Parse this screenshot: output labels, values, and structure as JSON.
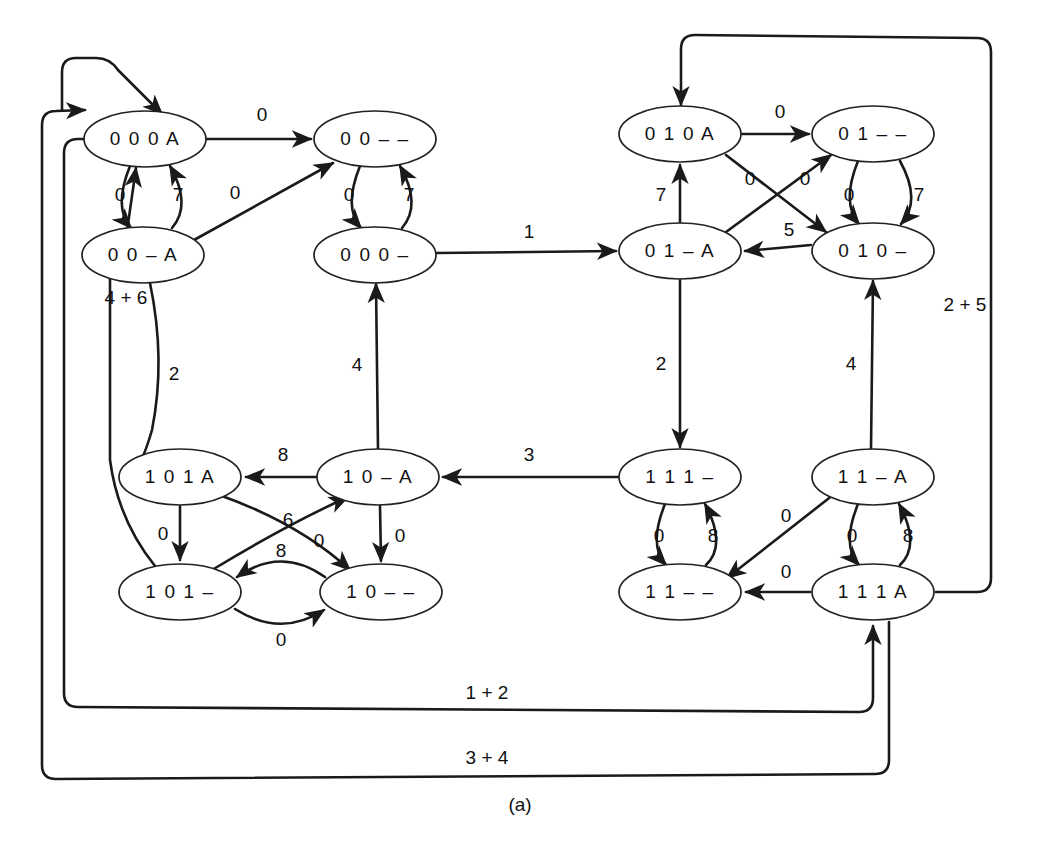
{
  "figure": {
    "caption": "(a)",
    "kind": "state-transition-diagram",
    "stroke_color": "#1a1a1a",
    "node_fill": "#ffffff",
    "background": "#ffffff"
  },
  "nodes": [
    {
      "id": "000A",
      "label": "0 0 0 A",
      "cx": 145,
      "cy": 139,
      "rx": 61,
      "ry": 28
    },
    {
      "id": "00--",
      "label": "0 0 – –",
      "cx": 375,
      "cy": 139,
      "rx": 61,
      "ry": 28
    },
    {
      "id": "00-A",
      "label": "0 0 – A",
      "cx": 143,
      "cy": 255,
      "rx": 61,
      "ry": 28
    },
    {
      "id": "000-",
      "label": "0 0 0 –",
      "cx": 375,
      "cy": 255,
      "rx": 61,
      "ry": 28
    },
    {
      "id": "010A",
      "label": "0 1 0 A",
      "cx": 680,
      "cy": 134,
      "rx": 61,
      "ry": 28
    },
    {
      "id": "01--",
      "label": "0 1 – –",
      "cx": 873,
      "cy": 134,
      "rx": 61,
      "ry": 28
    },
    {
      "id": "01-A",
      "label": "0 1 – A",
      "cx": 680,
      "cy": 251,
      "rx": 61,
      "ry": 28
    },
    {
      "id": "010-",
      "label": "0 1 0 –",
      "cx": 873,
      "cy": 251,
      "rx": 61,
      "ry": 28
    },
    {
      "id": "101A",
      "label": "1 0 1 A",
      "cx": 180,
      "cy": 477,
      "rx": 61,
      "ry": 28
    },
    {
      "id": "10-A",
      "label": "1 0 – A",
      "cx": 378,
      "cy": 477,
      "rx": 61,
      "ry": 28
    },
    {
      "id": "111-",
      "label": "1 1 1 –",
      "cx": 680,
      "cy": 477,
      "rx": 61,
      "ry": 28
    },
    {
      "id": "11-A",
      "label": "1 1 – A",
      "cx": 873,
      "cy": 477,
      "rx": 61,
      "ry": 28
    },
    {
      "id": "101-",
      "label": "1 0 1 –",
      "cx": 180,
      "cy": 592,
      "rx": 61,
      "ry": 28
    },
    {
      "id": "10--",
      "label": "1 0 – –",
      "cx": 381,
      "cy": 592,
      "rx": 61,
      "ry": 28
    },
    {
      "id": "11--",
      "label": "1 1 – –",
      "cx": 680,
      "cy": 592,
      "rx": 61,
      "ry": 28
    },
    {
      "id": "111A",
      "label": "1 1 1 A",
      "cx": 873,
      "cy": 592,
      "rx": 61,
      "ry": 28
    }
  ],
  "edges": [
    {
      "id": "e1",
      "from": "000A",
      "to": "00--",
      "label": "0",
      "lx": 262,
      "ly": 116
    },
    {
      "id": "e2",
      "from": "000A",
      "to": "00-A",
      "label": "0",
      "lx": 120,
      "ly": 196
    },
    {
      "id": "e3",
      "from": "00-A",
      "to": "000A",
      "label": "7",
      "lx": 178,
      "ly": 196
    },
    {
      "id": "e4",
      "from": "00-A",
      "to": "00--",
      "label": "0",
      "lx": 235,
      "ly": 194
    },
    {
      "id": "e5",
      "from": "00--",
      "to": "000-",
      "label": "0",
      "lx": 349,
      "ly": 196
    },
    {
      "id": "e6",
      "from": "000-",
      "to": "00--",
      "label": "7",
      "lx": 409,
      "ly": 196
    },
    {
      "id": "e7",
      "from": "000-",
      "to": "01-A",
      "label": "1",
      "lx": 529,
      "ly": 233
    },
    {
      "id": "e8",
      "from": "10-A",
      "to": "000-",
      "label": "4",
      "lx": 357,
      "ly": 366
    },
    {
      "id": "e9",
      "from": "00-A",
      "to": "101A",
      "label": "2",
      "lx": 174,
      "ly": 375
    },
    {
      "id": "e10",
      "from": "101-",
      "to": "000A",
      "label": "4 + 6",
      "lx": 126,
      "ly": 299
    },
    {
      "id": "e11",
      "from": "010A",
      "to": "01--",
      "label": "0",
      "lx": 780,
      "ly": 113
    },
    {
      "id": "e12",
      "from": "010A",
      "to": "010-",
      "label": "0",
      "lx": 750,
      "ly": 180
    },
    {
      "id": "e13",
      "from": "01-A",
      "to": "01--",
      "label": "0",
      "lx": 805,
      "ly": 180
    },
    {
      "id": "e14",
      "from": "01-A",
      "to": "010A",
      "label": "7",
      "lx": 661,
      "ly": 196
    },
    {
      "id": "e15",
      "from": "01--",
      "to": "010-",
      "label": "7",
      "lx": 919,
      "ly": 196
    },
    {
      "id": "e16",
      "from": "010-",
      "to": "01--",
      "label": "0",
      "lx": 849,
      "ly": 196
    },
    {
      "id": "e17",
      "from": "010-",
      "to": "01-A",
      "label": "5",
      "lx": 789,
      "ly": 231
    },
    {
      "id": "e18",
      "from": "01-A",
      "to": "111-",
      "label": "2",
      "lx": 661,
      "ly": 365
    },
    {
      "id": "e19",
      "from": "11-A",
      "to": "010-",
      "label": "4",
      "lx": 851,
      "ly": 365
    },
    {
      "id": "e20",
      "from": "111-",
      "to": "10-A",
      "label": "3",
      "lx": 529,
      "ly": 456
    },
    {
      "id": "e21",
      "from": "10-A",
      "to": "101A",
      "label": "8",
      "lx": 283,
      "ly": 456
    },
    {
      "id": "e22",
      "from": "101A",
      "to": "101-",
      "label": "0",
      "lx": 163,
      "ly": 535
    },
    {
      "id": "e23",
      "from": "101A",
      "to": "10--",
      "label": "0",
      "lx": 319,
      "ly": 542
    },
    {
      "id": "e24",
      "from": "10-A",
      "to": "101-",
      "label": "6",
      "lx": 288,
      "ly": 521
    },
    {
      "id": "e25",
      "from": "10-A",
      "to": "10--",
      "label": "0",
      "lx": 400,
      "ly": 537
    },
    {
      "id": "e26",
      "from": "10--",
      "to": "101-",
      "label": "8",
      "lx": 281,
      "ly": 552
    },
    {
      "id": "e27",
      "from": "101-",
      "to": "10--",
      "label": "0",
      "lx": 281,
      "ly": 641
    },
    {
      "id": "e28",
      "from": "111-",
      "to": "11--",
      "label": "0",
      "lx": 659,
      "ly": 537
    },
    {
      "id": "e29",
      "from": "11--",
      "to": "111-",
      "label": "8",
      "lx": 713,
      "ly": 537
    },
    {
      "id": "e30",
      "from": "11-A",
      "to": "11--",
      "label": "0",
      "lx": 786,
      "ly": 517
    },
    {
      "id": "e31",
      "from": "11-A",
      "to": "111A",
      "label": "0",
      "lx": 852,
      "ly": 537
    },
    {
      "id": "e32",
      "from": "111A",
      "to": "11-A",
      "label": "8",
      "lx": 908,
      "ly": 537
    },
    {
      "id": "e33",
      "from": "111A",
      "to": "11--",
      "label": "0",
      "lx": 786,
      "ly": 573
    },
    {
      "id": "e34",
      "from": "111A",
      "to": "010A",
      "label": "2 + 5",
      "lx": 965,
      "ly": 306
    },
    {
      "id": "e35",
      "from": "000A",
      "to": "111A",
      "label": "1 + 2",
      "lx": 487,
      "ly": 694
    },
    {
      "id": "e36",
      "from": "111A",
      "to": "000A",
      "label": "3 + 4",
      "lx": 487,
      "ly": 759
    }
  ]
}
